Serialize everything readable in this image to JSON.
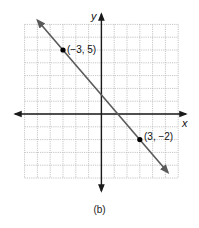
{
  "chart_data": {
    "type": "line",
    "title": "",
    "caption": "(b)",
    "xlabel": "x",
    "ylabel": "y",
    "xlim": [
      -6,
      6
    ],
    "ylim": [
      -5,
      7
    ],
    "grid": true,
    "legend": null,
    "series": [
      {
        "name": "line through (-3, 5) and (3, -2)",
        "slope": -1.1667,
        "intercept": 1.5,
        "x": [
          -5,
          5.2
        ],
        "y": [
          7.33,
          -4.57
        ]
      }
    ],
    "points": [
      {
        "x": -3,
        "y": 5,
        "label": "(−3, 5)"
      },
      {
        "x": 3,
        "y": -2,
        "label": "(3, −2)"
      }
    ],
    "annotations": [
      "(−3, 5)",
      "(3, −2)"
    ]
  },
  "labels": {
    "x_axis": "x",
    "y_axis": "y",
    "point1": "(−3, 5)",
    "point2": "(3, −2)",
    "caption": "(b)"
  },
  "colors": {
    "grid": "#b8b8b8",
    "axis": "#1a1a1a",
    "line": "#5a5a5a",
    "point": "#000000"
  }
}
